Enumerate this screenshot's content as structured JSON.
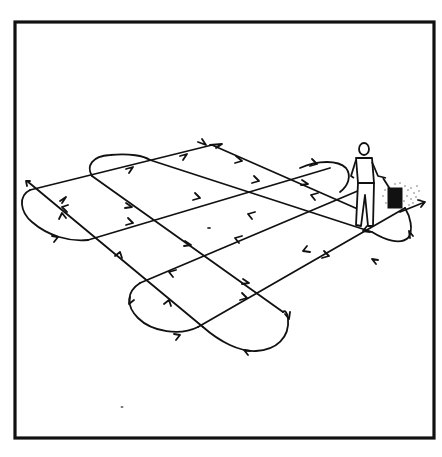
{
  "illustration": {
    "title": "Crisscross spreading pattern",
    "description": "Line drawing of a person pushing a broadcast spreader across a lawn, with arrows showing a two-direction crosshatch walking pattern with turnaround loops at the ends",
    "colors": {
      "ink": "#111111",
      "background": "#ffffff"
    },
    "frame": {
      "x": 15,
      "y": 22,
      "width": 419,
      "height": 416
    },
    "pattern": {
      "direction_a_passes": 3,
      "direction_b_passes": 3,
      "turn_loops": 5
    },
    "figure": {
      "subject": "person-with-spreader",
      "position": "right"
    }
  }
}
